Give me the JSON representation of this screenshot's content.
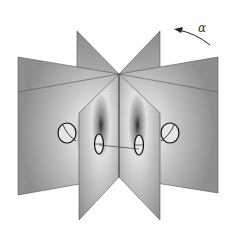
{
  "figure": {
    "rotation_label": "α",
    "colors": {
      "plane_fill": "#9a9a9a",
      "plane_light": "#d4d4d4",
      "plane_edge": "#555555",
      "ring": "#1a1a1a",
      "background": "#ffffff"
    }
  }
}
